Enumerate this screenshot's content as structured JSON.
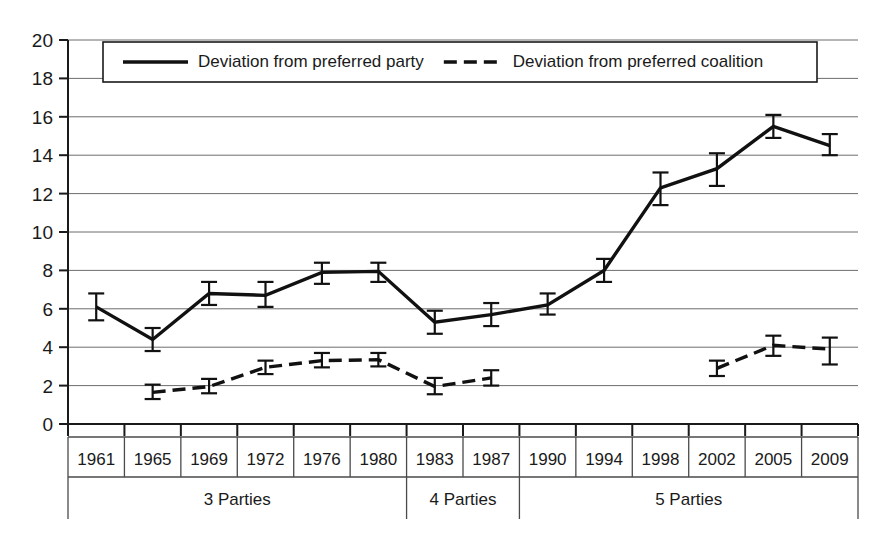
{
  "chart_data": {
    "type": "line",
    "title": "",
    "xlabel": "",
    "ylabel": "",
    "ylim": [
      0,
      20
    ],
    "ytick_step": 2,
    "grid": true,
    "legend_position": "top-inside",
    "categories": [
      "1961",
      "1965",
      "1969",
      "1972",
      "1976",
      "1980",
      "1983",
      "1987",
      "1990",
      "1994",
      "1998",
      "2002",
      "2005",
      "2009"
    ],
    "yticks": [
      "0",
      "2",
      "4",
      "6",
      "8",
      "10",
      "12",
      "14",
      "16",
      "18",
      "20"
    ],
    "series": [
      {
        "name": "Deviation from preferred party",
        "style": "solid",
        "values": [
          6.1,
          4.4,
          6.8,
          6.7,
          7.9,
          7.95,
          5.3,
          5.7,
          6.2,
          8.0,
          12.3,
          13.3,
          15.5,
          14.5
        ],
        "err_low": [
          5.4,
          3.8,
          6.2,
          6.1,
          7.3,
          7.4,
          4.7,
          5.1,
          5.7,
          7.4,
          11.4,
          12.4,
          14.9,
          14.0
        ],
        "err_high": [
          6.8,
          5.0,
          7.4,
          7.4,
          8.4,
          8.4,
          5.9,
          6.3,
          6.8,
          8.6,
          13.1,
          14.1,
          16.1,
          15.1
        ]
      },
      {
        "name": "Deviation from preferred coalition",
        "style": "dashed",
        "values": [
          null,
          1.65,
          1.95,
          2.95,
          3.3,
          3.35,
          1.95,
          2.4,
          null,
          null,
          null,
          2.9,
          4.1,
          3.9
        ],
        "err_low": [
          null,
          1.3,
          1.6,
          2.6,
          2.95,
          3.0,
          1.55,
          2.0,
          null,
          null,
          null,
          2.5,
          3.55,
          3.1
        ],
        "err_high": [
          null,
          2.05,
          2.35,
          3.3,
          3.7,
          3.7,
          2.4,
          2.8,
          null,
          null,
          null,
          3.3,
          4.6,
          4.5
        ]
      }
    ],
    "groups": [
      {
        "label": "3 Parties",
        "start": 0,
        "end": 5
      },
      {
        "label": "4 Parties",
        "start": 6,
        "end": 7
      },
      {
        "label": "5 Parties",
        "start": 8,
        "end": 13
      }
    ]
  },
  "legend": {
    "entries": [
      {
        "label": "Deviation from preferred party",
        "style": "solid"
      },
      {
        "label": "Deviation from preferred coalition",
        "style": "dashed"
      }
    ]
  }
}
